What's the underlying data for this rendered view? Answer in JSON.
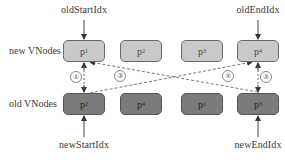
{
  "diagram": {
    "type": "vnode-double-ended-diff",
    "pointers": {
      "old_start": "oldStartIdx",
      "old_end": "oldEndIdx",
      "new_start": "newStartIdx",
      "new_end": "newEndIdx"
    },
    "rows": {
      "new_label": "new VNodes",
      "old_label": "old VNodes"
    },
    "new_vnodes": [
      {
        "base": "p",
        "sub": "1"
      },
      {
        "base": "p",
        "sub": "2"
      },
      {
        "base": "p",
        "sub": "3"
      },
      {
        "base": "p",
        "sub": "4"
      }
    ],
    "old_vnodes": [
      {
        "base": "p",
        "sub": "2"
      },
      {
        "base": "p",
        "sub": "4"
      },
      {
        "base": "p",
        "sub": "1"
      },
      {
        "base": "p",
        "sub": "3"
      }
    ],
    "comparisons": [
      {
        "step": "①",
        "from": "old p2 (start)",
        "to": "new p1 (start)"
      },
      {
        "step": "②",
        "from": "old p3 (end)",
        "to": "new p4 (end)"
      },
      {
        "step": "③",
        "from": "new p1 (start)",
        "to": "old p3 (end)"
      },
      {
        "step": "④",
        "from": "new p4 (end)",
        "to": "old p2 (start)"
      }
    ],
    "colors": {
      "new_node_fill": "#c9c9c9",
      "old_node_fill": "#7b7b7b",
      "arrow": "#444444",
      "dashed": "#777777"
    }
  }
}
